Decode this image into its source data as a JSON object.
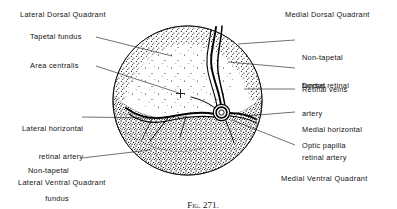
{
  "figure": {
    "caption_prefix": "Fig. 271.",
    "caption_title": "The fundus."
  },
  "labels": {
    "lateral_dorsal_quadrant": "Lateral Dorsal Quadrant",
    "tapetal_fundus": "Tapetal fundus",
    "area_centralis": "Area centralis",
    "lateral_horizontal_retinal_artery_l1": "Lateral horizontal",
    "lateral_horizontal_retinal_artery_l2": "retinal artery",
    "non_tapetal_fundus_left_l1": "Non-tapetal",
    "non_tapetal_fundus_left_l2": "fundus",
    "lateral_ventral_quadrant": "Lateral Ventral Quadrant",
    "medial_dorsal_quadrant": "Medial Dorsal Quadrant",
    "non_tapetal_fundus_right_l1": "Non-tapetal",
    "non_tapetal_fundus_right_l2": "fundus",
    "dorsal_retinal_artery_l1": "Dorsal retinal",
    "dorsal_retinal_artery_l2": "artery",
    "retinal_veins": "Retinal veins",
    "medial_horizontal_retinal_artery_l1": "Medial horizontal",
    "medial_horizontal_retinal_artery_l2": "retinal artery",
    "optic_papilla": "Optic papilla",
    "medial_ventral_quadrant": "Medial Ventral Quadrant"
  },
  "colors": {
    "ink": "#111111",
    "page": "#ffffff",
    "stipple": "#1a1a1a",
    "vessel": "#000000"
  }
}
